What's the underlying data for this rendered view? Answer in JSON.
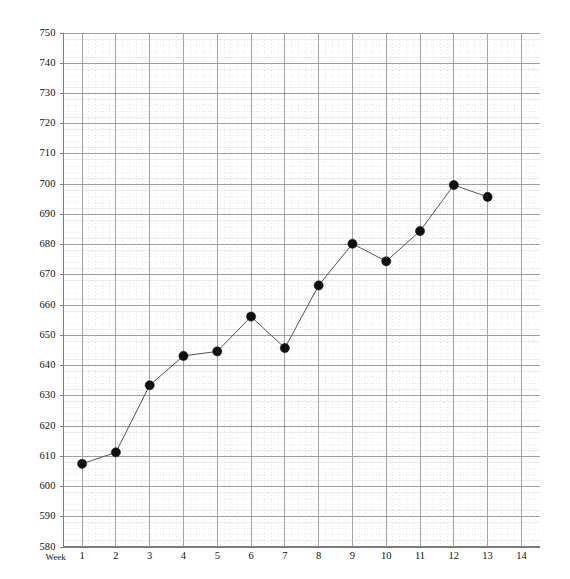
{
  "chart_data": {
    "type": "line",
    "title": "",
    "subtitle": "",
    "xlabel": "Week",
    "ylabel": "",
    "x": [
      1,
      2,
      3,
      4,
      5,
      6,
      7,
      8,
      9,
      10,
      11,
      12,
      13
    ],
    "values": [
      607.5,
      611.3,
      633.5,
      643.2,
      644.7,
      656.2,
      645.8,
      666.5,
      680.3,
      674.5,
      684.5,
      699.7,
      695.8
    ],
    "categories": [
      "1",
      "2",
      "3",
      "4",
      "5",
      "6",
      "7",
      "8",
      "9",
      "10",
      "11",
      "12",
      "13"
    ],
    "series": [
      {
        "name": "",
        "values": [
          607.5,
          611.3,
          633.5,
          643.2,
          644.7,
          656.2,
          645.8,
          666.5,
          680.3,
          674.5,
          684.5,
          699.7,
          695.8
        ]
      }
    ],
    "xlim": [
      0.45,
      14.55
    ],
    "ylim": [
      580,
      750
    ],
    "xticks": [
      1,
      2,
      3,
      4,
      5,
      6,
      7,
      8,
      9,
      10,
      11,
      12,
      13,
      14
    ],
    "xtick_labels": [
      "1",
      "2",
      "3",
      "4",
      "5",
      "6",
      "7",
      "8",
      "9",
      "10",
      "11",
      "12",
      "13",
      "14"
    ],
    "yticks": [
      580,
      590,
      600,
      610,
      620,
      630,
      640,
      650,
      660,
      670,
      680,
      690,
      700,
      710,
      720,
      730,
      740,
      750
    ],
    "ytick_labels": [
      "580",
      "590",
      "600",
      "610",
      "620",
      "630",
      "640",
      "650",
      "660",
      "670",
      "680",
      "690",
      "700",
      "710",
      "720",
      "730",
      "740",
      "750"
    ],
    "y_minor_step": 2,
    "grid": {
      "major_horizontal": true,
      "minor_horizontal": true,
      "major_vertical": true,
      "minor_vertical": true,
      "legend": "none"
    },
    "style": {
      "line_color": "#555555",
      "marker_color": "#101010",
      "marker_shape": "circle",
      "marker_size": 4.6,
      "major_grid_color": "#9a9a9a",
      "minor_grid_color": "#d8d8d8",
      "dotted_grid_color": "#e2dede",
      "axis_color": "#7d7d7d",
      "background": "#ffffff",
      "text_color": "#111111"
    }
  },
  "axis": {
    "x_title": "Week"
  }
}
